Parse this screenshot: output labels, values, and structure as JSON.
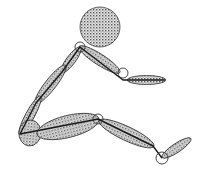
{
  "diagram": {
    "type": "segmented-stick-figure",
    "colors": {
      "outline": "#222222",
      "fill_dot": "#555555",
      "fill_bg": "#e8e8e8",
      "joint_fill": "#ffffff",
      "background": "#ffffff"
    },
    "head": {
      "cx": 100,
      "cy": 27,
      "r": 20
    },
    "joints": [
      {
        "name": "shoulder",
        "x": 80,
        "y": 47,
        "r": 5
      },
      {
        "name": "elbow",
        "x": 123,
        "y": 73,
        "r": 5
      },
      {
        "name": "knee",
        "x": 98,
        "y": 119,
        "r": 5
      },
      {
        "name": "ankle",
        "x": 162,
        "y": 158,
        "r": 6
      }
    ],
    "segments": [
      {
        "name": "upper-arm",
        "x1": 80,
        "y1": 47,
        "x2": 119,
        "y2": 72,
        "w": 11
      },
      {
        "name": "forearm-hand",
        "x1": 128,
        "y1": 80,
        "x2": 165,
        "y2": 80,
        "w": 9
      },
      {
        "name": "upper-trunk",
        "x1": 80,
        "y1": 48,
        "x2": 62,
        "y2": 72,
        "w": 9
      },
      {
        "name": "mid-trunk",
        "x1": 65,
        "y1": 66,
        "x2": 36,
        "y2": 103,
        "w": 11
      },
      {
        "name": "lower-trunk",
        "x1": 40,
        "y1": 97,
        "x2": 20,
        "y2": 134,
        "w": 9
      },
      {
        "name": "pelvis",
        "x1": 20,
        "y1": 132,
        "x2": 40,
        "y2": 134,
        "w": 26
      },
      {
        "name": "thigh",
        "x1": 38,
        "y1": 134,
        "x2": 98,
        "y2": 119,
        "w": 22
      },
      {
        "name": "shank",
        "x1": 100,
        "y1": 121,
        "x2": 153,
        "y2": 146,
        "w": 14
      },
      {
        "name": "foot",
        "x1": 163,
        "y1": 157,
        "x2": 190,
        "y2": 139,
        "w": 9
      }
    ],
    "skeleton_line": [
      [
        165,
        80
      ],
      [
        123,
        80
      ],
      [
        80,
        47
      ],
      [
        62,
        72
      ],
      [
        36,
        103
      ],
      [
        20,
        134
      ],
      [
        98,
        119
      ],
      [
        153,
        146
      ],
      [
        162,
        158
      ]
    ]
  }
}
